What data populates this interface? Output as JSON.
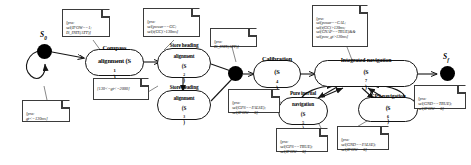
{
  "diagram": {
    "stroke_color": "#151515",
    "note_border_color": "#3b3b3b",
    "background": "#ffffff"
  },
  "nodes": {
    "start": {
      "label": "S",
      "sub": "0"
    },
    "final": {
      "label": "S",
      "sub": "f"
    },
    "junction1": {
      "label": ""
    },
    "junction2": {
      "label": ""
    }
  },
  "states": [
    {
      "id": "s1",
      "line1": "Compass",
      "line2": "alignment (S",
      "sub": "1",
      "tail": ")"
    },
    {
      "id": "s2",
      "line1": "Store heading",
      "line2": "alignment",
      "line3": "(S",
      "sub": "2",
      "tail": ")"
    },
    {
      "id": "s3",
      "line1": "Store heading",
      "line2": "alignment",
      "line3": "(S",
      "sub": "3",
      "tail": ")"
    },
    {
      "id": "s4",
      "line1": "Calibration",
      "line2": "(S",
      "sub": "4",
      "tail": ")"
    },
    {
      "id": "s5",
      "line1": "Pure inertial",
      "line2": "navigation",
      "line3": "(S",
      "sub": "5",
      "tail": ")"
    },
    {
      "id": "s6",
      "line1": "GPS navigation",
      "line2": "(S",
      "sub": "6",
      "tail": ")"
    },
    {
      "id": "s7",
      "line1": "Integrated navigation",
      "line2": "(S",
      "sub": "7",
      "tail": ")"
    }
  ],
  "notes": [
    {
      "id": "n1",
      "text": "[pre:\nsel(IFOW==1;\nIS_INIT(ATT)]"
    },
    {
      "id": "n2",
      "text": "[pre:\nsel(power==GC;\nsel(t(GC)>130ms]"
    },
    {
      "id": "n3",
      "text": "[pre:\ngt<=130ms]"
    },
    {
      "id": "n4",
      "text": "[130<=gt<=2000]"
    },
    {
      "id": "n5",
      "text": "[pre:\nIS_INIT(ATT)]"
    },
    {
      "id": "n6",
      "text": "[pre:\nsel(power==CAL;\nsel(t(GC)>130ms;\nsel(GNAP==TRUE)&&\nsel(pow_gt>130ms]"
    },
    {
      "id": "n7",
      "text": "[pre:\nsel(GPS==FALSE);\nsel(IFOW==6]"
    },
    {
      "id": "n8",
      "text": "[pre:\nsel(GPS==TRUE);\nsel(IFOW==6]"
    },
    {
      "id": "n9",
      "text": "[pre:\nsel(GND==FALSE);\nsel(IFOW==6]"
    },
    {
      "id": "n10",
      "text": "[pre:\nsel(GND==TRUE);\nsel(IFOW==6]"
    }
  ]
}
